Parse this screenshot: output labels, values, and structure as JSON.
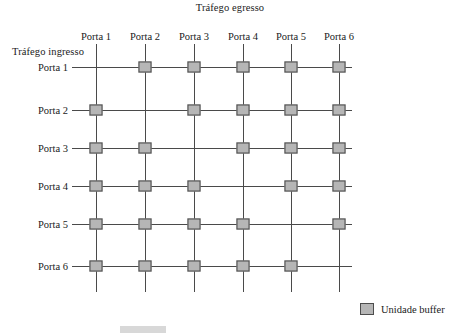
{
  "diagram": {
    "title_top": "Tráfego egresso",
    "title_left": "Tráfego ingresso",
    "column_headers": [
      "Porta 1",
      "Porta 2",
      "Porta 3",
      "Porta 4",
      "Porta 5",
      "Porta 6"
    ],
    "row_headers": [
      "Porta 1",
      "Porta 2",
      "Porta 3",
      "Porta 4",
      "Porta 5",
      "Porta 6"
    ],
    "grid": {
      "columns_x": [
        96,
        145,
        194,
        243,
        291,
        339
      ],
      "rows_y": [
        67,
        110,
        148,
        186,
        224,
        266
      ],
      "hline_start_x": 72,
      "hline_end_x": 352,
      "vline_start_y": 44,
      "vline_end_y": 292
    },
    "buffer_matrix": [
      [
        0,
        1,
        1,
        1,
        1,
        1
      ],
      [
        1,
        0,
        1,
        1,
        1,
        1
      ],
      [
        1,
        1,
        0,
        1,
        1,
        1
      ],
      [
        1,
        1,
        1,
        0,
        1,
        1
      ],
      [
        1,
        1,
        1,
        1,
        0,
        1
      ],
      [
        1,
        1,
        1,
        1,
        1,
        0
      ]
    ],
    "colors": {
      "buffer_fill": "#b6b6b6",
      "buffer_border": "#4d4d4d",
      "line": "#4a4a4a",
      "text": "#1b1b1b",
      "background": "#ffffff"
    }
  },
  "legend": {
    "label": "Unidade buffer"
  },
  "caption": {
    "text": ""
  }
}
